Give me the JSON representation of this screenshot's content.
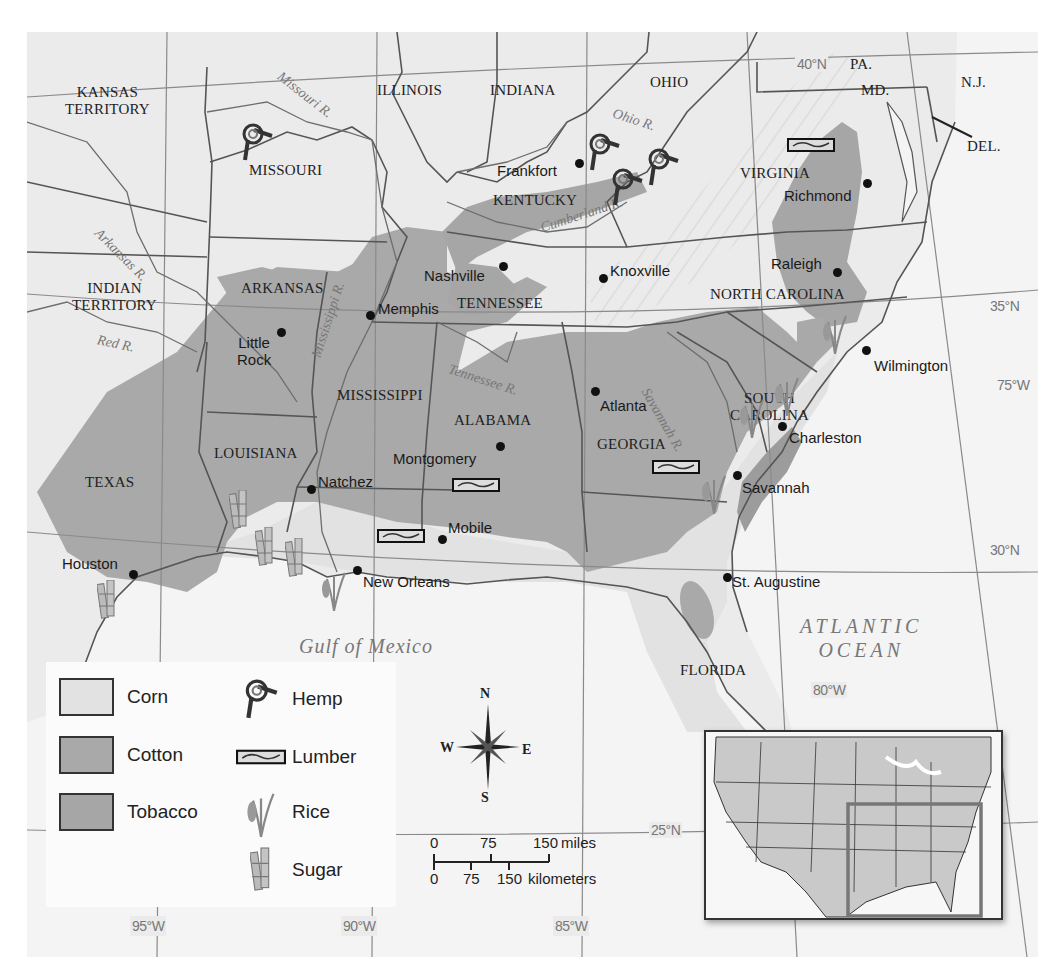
{
  "map": {
    "title": "Agricultural Products of the Antebellum South",
    "colors": {
      "background_land": "#ebebeb",
      "ocean": "#f4f4f4",
      "corn": "#e2e2e2",
      "cotton": "#a9a9a9",
      "tobacco": "#a6a6a6",
      "border": "#555555",
      "graticule": "#777777"
    },
    "states": [
      {
        "name": "KANSAS\nTERRITORY",
        "line1": "KANSAS",
        "line2": "TERRITORY"
      },
      {
        "name": "MISSOURI"
      },
      {
        "name": "ILLINOIS"
      },
      {
        "name": "INDIANA"
      },
      {
        "name": "OHIO"
      },
      {
        "name": "PA."
      },
      {
        "name": "MD."
      },
      {
        "name": "N.J."
      },
      {
        "name": "DEL."
      },
      {
        "name": "VIRGINIA"
      },
      {
        "name": "KENTUCKY"
      },
      {
        "name": "INDIAN\nTERRITORY",
        "line1": "INDIAN",
        "line2": "TERRITORY"
      },
      {
        "name": "ARKANSAS"
      },
      {
        "name": "TENNESSEE"
      },
      {
        "name": "NORTH CAROLINA"
      },
      {
        "name": "SOUTH\nCAROLINA",
        "line1": "SOUTH",
        "line2": "CAROLINA"
      },
      {
        "name": "MISSISSIPPI"
      },
      {
        "name": "ALABAMA"
      },
      {
        "name": "GEORGIA"
      },
      {
        "name": "LOUISIANA"
      },
      {
        "name": "TEXAS"
      },
      {
        "name": "FLORIDA"
      }
    ],
    "cities": [
      {
        "name": "Frankfort"
      },
      {
        "name": "Richmond"
      },
      {
        "name": "Nashville"
      },
      {
        "name": "Knoxville"
      },
      {
        "name": "Raleigh"
      },
      {
        "name": "Memphis"
      },
      {
        "name": "Little\nRock",
        "line1": "Little",
        "line2": "Rock"
      },
      {
        "name": "Wilmington"
      },
      {
        "name": "Atlanta"
      },
      {
        "name": "Charleston"
      },
      {
        "name": "Montgomery"
      },
      {
        "name": "Natchez"
      },
      {
        "name": "Savannah"
      },
      {
        "name": "Mobile"
      },
      {
        "name": "Houston"
      },
      {
        "name": "New Orleans"
      },
      {
        "name": "St. Augustine"
      }
    ],
    "rivers": [
      {
        "name": "Missouri R."
      },
      {
        "name": "Ohio R."
      },
      {
        "name": "Cumberland R."
      },
      {
        "name": "Arkansas R."
      },
      {
        "name": "Mississippi R."
      },
      {
        "name": "Red R."
      },
      {
        "name": "Tennessee R."
      },
      {
        "name": "Savannah R."
      }
    ],
    "water_bodies": [
      {
        "name": "Gulf of Mexico"
      },
      {
        "line1": "ATLANTIC",
        "line2": "OCEAN"
      }
    ],
    "graticule": {
      "latitudes": [
        "40°N",
        "35°N",
        "30°N",
        "25°N"
      ],
      "longitudes": [
        "95°W",
        "90°W",
        "85°W",
        "80°W",
        "75°W"
      ]
    },
    "legend": {
      "areas": [
        {
          "label": "Corn",
          "color": "#e2e2e2"
        },
        {
          "label": "Cotton",
          "color": "#a9a9a9"
        },
        {
          "label": "Tobacco",
          "color": "#a6a6a6"
        }
      ],
      "symbols": [
        {
          "label": "Hemp",
          "icon": "hemp-rope-knot-icon"
        },
        {
          "label": "Lumber",
          "icon": "lumber-plank-icon"
        },
        {
          "label": "Rice",
          "icon": "rice-stalk-icon"
        },
        {
          "label": "Sugar",
          "icon": "sugarcane-icon"
        }
      ]
    },
    "compass": {
      "n": "N",
      "s": "S",
      "e": "E",
      "w": "W"
    },
    "scale": {
      "miles": {
        "ticks": [
          "0",
          "75",
          "150"
        ],
        "unit": "miles"
      },
      "km": {
        "ticks": [
          "0",
          "75",
          "150"
        ],
        "unit": "kilometers"
      }
    },
    "inset": {
      "label": "United States locator map",
      "highlight": "Southeastern region"
    }
  }
}
